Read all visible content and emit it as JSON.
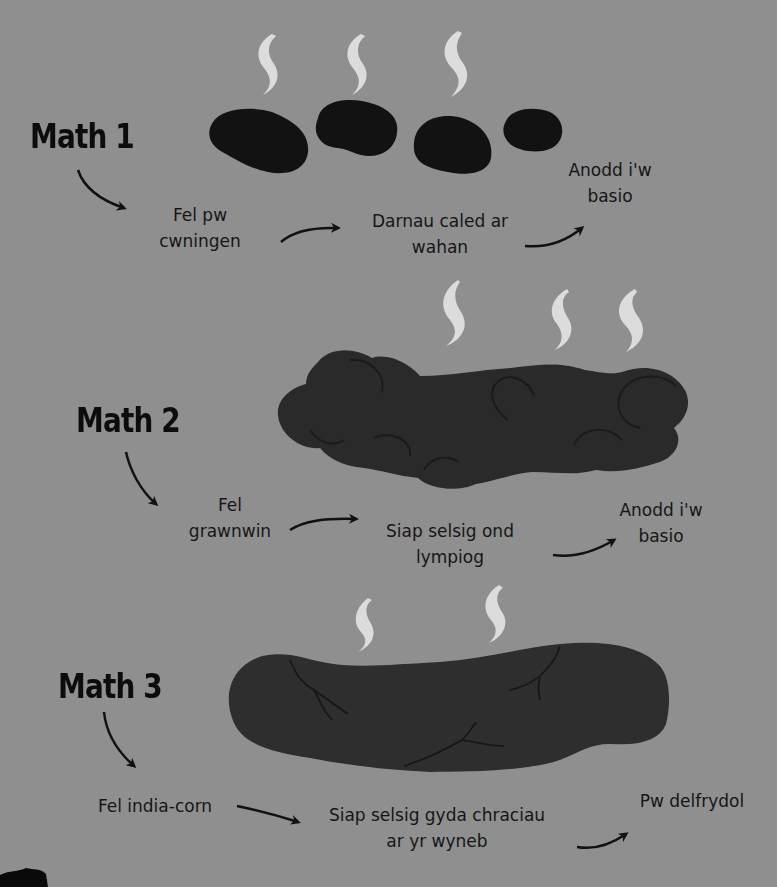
{
  "colors": {
    "background": "#8f8f8f",
    "stool_type1": "#121212",
    "stool_type2": "#2b2b2b",
    "stool_type3": "#2e2e2e",
    "steam": "#dcdcdc",
    "text": "#161616"
  },
  "types": [
    {
      "heading": "Math 1",
      "description_lines": [
        "Fel pw",
        "cwningen"
      ],
      "shape_lines": [
        "Darnau caled ar",
        "wahan"
      ],
      "result_lines": [
        "Anodd i'w",
        "basio"
      ],
      "steam_count": 3,
      "illustration": "separate-hard-lumps-icon"
    },
    {
      "heading": "Math 2",
      "description_lines": [
        "Fel",
        "grawnwin"
      ],
      "shape_lines": [
        "Siap selsig ond",
        "lympiog"
      ],
      "result_lines": [
        "Anodd i'w",
        "basio"
      ],
      "steam_count": 3,
      "illustration": "lumpy-sausage-icon"
    },
    {
      "heading": "Math 3",
      "description_lines": [
        "Fel india-corn"
      ],
      "shape_lines": [
        "Siap selsig gyda chraciau",
        "ar yr wyneb"
      ],
      "result_lines": [
        "Pw delfrydol"
      ],
      "steam_count": 2,
      "illustration": "cracked-sausage-icon"
    }
  ]
}
